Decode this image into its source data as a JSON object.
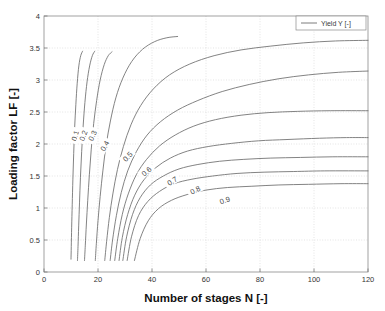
{
  "chart_data": {
    "type": "line",
    "title": "",
    "xlabel": "Number of stages N [-]",
    "ylabel": "Loading factor LF [-]",
    "xlim": [
      0,
      120
    ],
    "ylim": [
      0,
      4
    ],
    "xticks": [
      "0",
      "20",
      "40",
      "60",
      "80",
      "100",
      "120"
    ],
    "xtick_values": [
      0,
      20,
      40,
      60,
      80,
      100,
      120
    ],
    "yticks": [
      "0",
      "0.5",
      "1",
      "1.5",
      "2",
      "2.5",
      "3",
      "3.5",
      "4"
    ],
    "ytick_values": [
      0,
      0.5,
      1,
      1.5,
      2,
      2.5,
      3,
      3.5,
      4
    ],
    "grid": true,
    "legend": {
      "position": "top-right",
      "entries": [
        "Yield Y [-]"
      ]
    },
    "series": [
      {
        "name": "0.1",
        "label": "0.1",
        "label_at": {
          "x": 11.6,
          "y": 2.13
        },
        "label_rotation": -72,
        "points": [
          [
            10.0,
            0.2
          ],
          [
            10.1,
            0.4
          ],
          [
            10.25,
            0.7
          ],
          [
            10.45,
            1.05
          ],
          [
            10.7,
            1.45
          ],
          [
            11.0,
            1.85
          ],
          [
            11.35,
            2.25
          ],
          [
            11.8,
            2.62
          ],
          [
            12.3,
            2.95
          ],
          [
            12.9,
            3.22
          ],
          [
            13.6,
            3.38
          ],
          [
            14.3,
            3.45
          ]
        ]
      },
      {
        "name": "0.2",
        "label": "0.2",
        "label_at": {
          "x": 14.6,
          "y": 2.13
        },
        "label_rotation": -70,
        "points": [
          [
            12.4,
            0.18
          ],
          [
            12.6,
            0.4
          ],
          [
            12.85,
            0.72
          ],
          [
            13.15,
            1.08
          ],
          [
            13.5,
            1.48
          ],
          [
            13.95,
            1.88
          ],
          [
            14.5,
            2.28
          ],
          [
            15.15,
            2.65
          ],
          [
            15.95,
            2.97
          ],
          [
            16.9,
            3.22
          ],
          [
            17.9,
            3.38
          ],
          [
            18.8,
            3.45
          ]
        ]
      },
      {
        "name": "0.3",
        "label": "0.3",
        "label_at": {
          "x": 18.0,
          "y": 2.13
        },
        "label_rotation": -66,
        "points": [
          [
            15.0,
            0.18
          ],
          [
            15.3,
            0.42
          ],
          [
            15.7,
            0.75
          ],
          [
            16.2,
            1.12
          ],
          [
            16.8,
            1.52
          ],
          [
            17.5,
            1.92
          ],
          [
            18.4,
            2.32
          ],
          [
            19.5,
            2.68
          ],
          [
            20.8,
            3.0
          ],
          [
            22.3,
            3.24
          ],
          [
            23.8,
            3.38
          ],
          [
            25.2,
            3.44
          ]
        ]
      },
      {
        "name": "0.4",
        "label": "0.4",
        "label_at": {
          "x": 22.5,
          "y": 1.97
        },
        "label_rotation": -60,
        "points": [
          [
            19.0,
            0.18
          ],
          [
            19.4,
            0.45
          ],
          [
            20.0,
            0.8
          ],
          [
            20.8,
            1.18
          ],
          [
            21.8,
            1.58
          ],
          [
            23.0,
            1.98
          ],
          [
            24.6,
            2.36
          ],
          [
            26.6,
            2.72
          ],
          [
            29.2,
            3.03
          ],
          [
            32.5,
            3.29
          ],
          [
            36.5,
            3.48
          ],
          [
            41.0,
            3.6
          ],
          [
            45.5,
            3.66
          ],
          [
            49.5,
            3.68
          ]
        ]
      },
      {
        "name": "0.5",
        "label": "0.5",
        "label_at": {
          "x": 31.0,
          "y": 1.8
        },
        "label_rotation": -46,
        "points": [
          [
            22.5,
            0.18
          ],
          [
            23.2,
            0.48
          ],
          [
            24.2,
            0.85
          ],
          [
            25.5,
            1.22
          ],
          [
            27.2,
            1.6
          ],
          [
            29.4,
            1.96
          ],
          [
            32.2,
            2.3
          ],
          [
            35.8,
            2.6
          ],
          [
            40.5,
            2.86
          ],
          [
            46.5,
            3.08
          ],
          [
            54.0,
            3.25
          ],
          [
            63.0,
            3.38
          ],
          [
            73.0,
            3.47
          ],
          [
            84.0,
            3.53
          ],
          [
            96.0,
            3.58
          ],
          [
            108.0,
            3.61
          ],
          [
            120.0,
            3.62
          ]
        ]
      },
      {
        "name": "0.6",
        "label": "0.6",
        "label_at": {
          "x": 38.0,
          "y": 1.57
        },
        "label_rotation": -40,
        "points": [
          [
            24.5,
            0.18
          ],
          [
            25.4,
            0.5
          ],
          [
            26.8,
            0.88
          ],
          [
            28.6,
            1.24
          ],
          [
            31.0,
            1.58
          ],
          [
            34.2,
            1.88
          ],
          [
            38.2,
            2.14
          ],
          [
            43.2,
            2.35
          ],
          [
            49.5,
            2.53
          ],
          [
            57.0,
            2.68
          ],
          [
            66.0,
            2.82
          ],
          [
            76.0,
            2.93
          ],
          [
            87.0,
            3.02
          ],
          [
            98.0,
            3.08
          ],
          [
            109.0,
            3.12
          ],
          [
            120.0,
            3.14
          ]
        ]
      },
      {
        "name": "0.7",
        "label": "0.7",
        "label_at": {
          "x": 47.5,
          "y": 1.42
        },
        "label_rotation": -32,
        "points": [
          [
            26.2,
            0.18
          ],
          [
            27.3,
            0.52
          ],
          [
            29.0,
            0.9
          ],
          [
            31.2,
            1.22
          ],
          [
            34.2,
            1.52
          ],
          [
            38.0,
            1.76
          ],
          [
            42.8,
            1.97
          ],
          [
            48.6,
            2.14
          ],
          [
            55.5,
            2.28
          ],
          [
            63.5,
            2.38
          ],
          [
            73.0,
            2.45
          ],
          [
            83.0,
            2.49
          ],
          [
            94.0,
            2.51
          ],
          [
            106.0,
            2.52
          ],
          [
            120.0,
            2.52
          ]
        ]
      },
      {
        "name": "0.8",
        "label": "0.8",
        "label_at": {
          "x": 56.0,
          "y": 1.28
        },
        "label_rotation": -26,
        "points": [
          [
            27.8,
            0.18
          ],
          [
            29.0,
            0.54
          ],
          [
            31.0,
            0.9
          ],
          [
            33.6,
            1.2
          ],
          [
            37.0,
            1.44
          ],
          [
            41.4,
            1.63
          ],
          [
            46.8,
            1.78
          ],
          [
            53.2,
            1.89
          ],
          [
            60.8,
            1.96
          ],
          [
            69.5,
            2.01
          ],
          [
            79.5,
            2.05
          ],
          [
            90.0,
            2.07
          ],
          [
            102.0,
            2.09
          ],
          [
            112.0,
            2.1
          ],
          [
            120.0,
            2.1
          ]
        ]
      },
      {
        "name": "0.9",
        "label": "0.9",
        "label_at": {
          "x": 67.0,
          "y": 1.12
        },
        "label_rotation": -20,
        "points": [
          [
            29.2,
            0.18
          ],
          [
            30.6,
            0.55
          ],
          [
            32.8,
            0.9
          ],
          [
            35.6,
            1.16
          ],
          [
            39.4,
            1.36
          ],
          [
            44.2,
            1.5
          ],
          [
            50.0,
            1.61
          ],
          [
            57.0,
            1.68
          ],
          [
            65.0,
            1.73
          ],
          [
            74.0,
            1.76
          ],
          [
            84.0,
            1.78
          ],
          [
            95.0,
            1.79
          ],
          [
            107.0,
            1.8
          ],
          [
            120.0,
            1.8
          ]
        ]
      },
      {
        "name": "lower-extra-1",
        "label": "",
        "points": [
          [
            30.8,
            0.18
          ],
          [
            32.4,
            0.55
          ],
          [
            35.0,
            0.88
          ],
          [
            38.4,
            1.1
          ],
          [
            42.8,
            1.26
          ],
          [
            48.2,
            1.38
          ],
          [
            54.8,
            1.45
          ],
          [
            62.5,
            1.5
          ],
          [
            71.5,
            1.54
          ],
          [
            81.5,
            1.56
          ],
          [
            92.5,
            1.57
          ],
          [
            104.0,
            1.58
          ],
          [
            120.0,
            1.58
          ]
        ]
      },
      {
        "name": "lower-extra-2",
        "label": "",
        "points": [
          [
            33.5,
            0.18
          ],
          [
            35.6,
            0.52
          ],
          [
            38.6,
            0.8
          ],
          [
            42.4,
            0.99
          ],
          [
            47.2,
            1.12
          ],
          [
            53.0,
            1.21
          ],
          [
            60.0,
            1.28
          ],
          [
            68.0,
            1.32
          ],
          [
            77.0,
            1.34
          ],
          [
            87.0,
            1.36
          ],
          [
            98.0,
            1.37
          ],
          [
            110.0,
            1.38
          ],
          [
            120.0,
            1.38
          ]
        ]
      }
    ],
    "contour_levels": [
      0.1,
      0.2,
      0.3,
      0.4,
      0.5,
      0.6,
      0.7,
      0.8,
      0.9
    ]
  },
  "colors": {
    "curve": "#6d6d6d",
    "grid": "#d9d9d9",
    "axis": "#7a7a7a",
    "text": "#1a1a1a",
    "background": "#ffffff"
  }
}
